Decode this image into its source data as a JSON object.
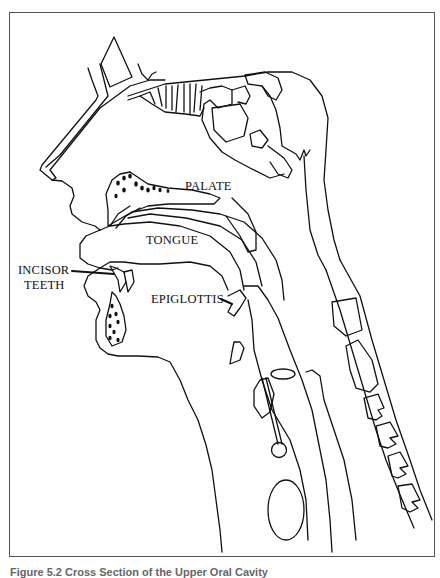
{
  "figure": {
    "title": "Cross Section of the Upper Oral Cavity",
    "caption": "Figure 5.2  Cross Section of the Upper Oral Cavity",
    "line_color": "#111111",
    "frame_color": "#555555"
  },
  "labels": {
    "palate": "PALATE",
    "tongue": "TONGUE",
    "incisor_line1": "INCISOR",
    "incisor_line2": "TEETH",
    "epiglottis": "EPIGLOTTIS"
  }
}
